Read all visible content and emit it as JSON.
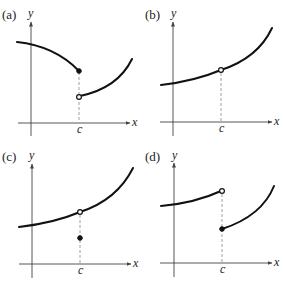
{
  "panels": [
    {
      "id": "a",
      "label": "(a)",
      "y_axis_label": "y",
      "x_axis_label": "x",
      "c_label": "c",
      "description": "Left branch decreasing ending in filled point at x=c; right branch starts with open point lower at x=c and increases (jump discontinuity)",
      "points": [
        {
          "type": "closed",
          "position": "upper"
        },
        {
          "type": "open",
          "position": "lower"
        }
      ]
    },
    {
      "id": "b",
      "label": "(b)",
      "y_axis_label": "y",
      "x_axis_label": "x",
      "c_label": "c",
      "description": "Increasing curve with a hole (open point) at x=c (removable discontinuity, f(c) undefined)",
      "points": [
        {
          "type": "open",
          "position": "on-curve"
        }
      ]
    },
    {
      "id": "c",
      "label": "(c)",
      "y_axis_label": "y",
      "x_axis_label": "x",
      "c_label": "c",
      "description": "Increasing curve with open point at x=c and filled point below the curve at x=c (removable discontinuity, f(c) defined elsewhere)",
      "points": [
        {
          "type": "open",
          "position": "on-curve"
        },
        {
          "type": "closed",
          "position": "below"
        }
      ]
    },
    {
      "id": "d",
      "label": "(d)",
      "y_axis_label": "y",
      "x_axis_label": "x",
      "c_label": "c",
      "description": "Left branch increasing ending in open point at x=c; right branch starts with filled point lower at x=c and increases (jump discontinuity)",
      "points": [
        {
          "type": "open",
          "position": "upper"
        },
        {
          "type": "closed",
          "position": "lower"
        }
      ]
    }
  ],
  "colors": {
    "curve": "#111111",
    "axis": "#444444",
    "dashed_guide": "#888888",
    "background": "#ffffff"
  }
}
